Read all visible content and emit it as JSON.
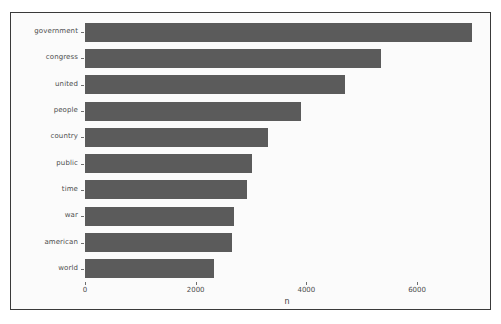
{
  "chart_data": {
    "type": "bar",
    "orientation": "horizontal",
    "title": "",
    "xlabel": "n",
    "ylabel": "",
    "categories": [
      "government",
      "congress",
      "united",
      "people",
      "country",
      "public",
      "time",
      "war",
      "american",
      "world"
    ],
    "values": [
      7000,
      5350,
      4700,
      3900,
      3300,
      3020,
      2930,
      2700,
      2650,
      2330
    ],
    "xlim": [
      0,
      7300
    ],
    "xticks": [
      0,
      2000,
      4000,
      6000
    ],
    "xtick_labels": [
      "0",
      "2000",
      "4000",
      "6000"
    ],
    "grid": false,
    "legend": null,
    "bar_color": "#5b5b5b",
    "panel_background": "#fbfbfb",
    "border_color": "#3a3a3a",
    "tick_color": "#4d4d4d"
  },
  "figure": {
    "background": "#ffffff"
  }
}
